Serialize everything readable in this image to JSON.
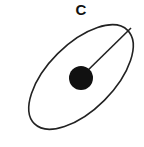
{
  "diagram": {
    "label": "C",
    "shape": "ellipse",
    "stroke_color": "#222222",
    "fill_color": "#111111",
    "ellipse": {
      "cx": 81,
      "cy": 77,
      "rx": 64,
      "ry": 32,
      "rotation_deg": -45
    },
    "center_dot": {
      "cx": 81,
      "cy": 77,
      "r": 12
    },
    "radius_line": {
      "x1": 81,
      "y1": 77,
      "x2": 131,
      "y2": 28
    }
  }
}
